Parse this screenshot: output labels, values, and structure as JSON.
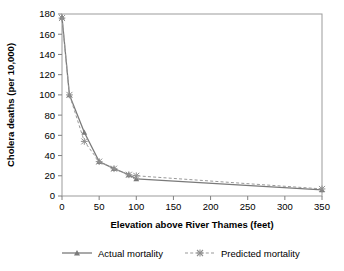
{
  "chart_data": {
    "type": "line",
    "title": "",
    "xlabel": "Elevation above River Thames (feet)",
    "ylabel": "Cholera deaths (per 10,000)",
    "xlim": [
      0,
      350
    ],
    "ylim": [
      0,
      180
    ],
    "xticks": [
      0,
      50,
      100,
      150,
      200,
      250,
      300,
      350
    ],
    "yticks": [
      0,
      20,
      40,
      60,
      80,
      100,
      120,
      140,
      160,
      180
    ],
    "xtick_labels": [
      "0",
      "50",
      "100",
      "150",
      "200",
      "250",
      "300",
      "350"
    ],
    "ytick_labels": [
      "0",
      "20",
      "40",
      "60",
      "80",
      "100",
      "120",
      "140",
      "160",
      "180"
    ],
    "grid": false,
    "legend_position": "bottom",
    "x": [
      0,
      10,
      30,
      50,
      70,
      90,
      100,
      350
    ],
    "series": [
      {
        "name": "Actual mortality",
        "marker": "triangle",
        "linestyle": "solid",
        "color": "#7a7a7a",
        "values": [
          177,
          100,
          63,
          34,
          27,
          21,
          17,
          6
        ]
      },
      {
        "name": "Predicted mortality",
        "marker": "asterisk",
        "linestyle": "dashed",
        "color": "#9a9a9a",
        "values": [
          176,
          100,
          54,
          34,
          27,
          21,
          20,
          7
        ]
      }
    ]
  },
  "axes": {
    "x_title": "Elevation above River Thames (feet)",
    "y_title": "Cholera deaths (per 10,000)"
  },
  "legend": {
    "items": [
      {
        "label": "Actual mortality"
      },
      {
        "label": "Predicted mortality"
      }
    ]
  },
  "colors": {
    "actual": "#7a7a7a",
    "predicted": "#9a9a9a",
    "axis": "#808080",
    "text": "#000000"
  }
}
